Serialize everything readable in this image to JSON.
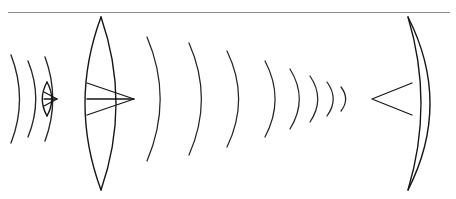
{
  "figure": {
    "kind": "line-drawing",
    "width": 456,
    "height": 199,
    "background_color": "#ffffff",
    "ink_color": "#1a1a1a",
    "rule_color": "#8e8e8e",
    "labels": [],
    "annotations": []
  },
  "top_rule": {
    "name": "horizontal-top-rule",
    "x1": 8,
    "y1": 12.5,
    "x2": 450,
    "y2": 12.5,
    "color": "#8e8e8e",
    "width": 1.1
  },
  "optical_axis": {
    "y": 99,
    "x_start": 18,
    "x_end": 440
  },
  "source_wavefronts": {
    "name": "diverging-source-wavefronts",
    "description": "Three short arcs diverging rightward from a point source at far left",
    "count": 3,
    "center_y": 99,
    "arcs": [
      {
        "x_vertex": 22,
        "radius": 46,
        "half_height": 44,
        "bulge": 11
      },
      {
        "x_vertex": 38,
        "radius": 40,
        "half_height": 38,
        "bulge": 10
      },
      {
        "x_vertex": 55,
        "radius": 44,
        "half_height": 42,
        "bulge": 10
      }
    ]
  },
  "small_lens": {
    "name": "small-biconvex-lens",
    "center_x": 47,
    "center_y": 99,
    "half_height": 17,
    "bulge": 4.5,
    "cone": {
      "apex_x": 57,
      "base_x": 44,
      "half_height": 7
    }
  },
  "main_lens": {
    "name": "large-biconvex-lens",
    "center_x": 101,
    "top_y": 17,
    "bottom_y": 190,
    "left_bulge": 16,
    "right_bulge": 15,
    "cone": {
      "base_x": 87,
      "apex_x": 134,
      "half_height": 16
    }
  },
  "converging_wavefronts": {
    "name": "converging-wavefronts",
    "description": "Series of arcs that shrink as they converge toward a focus on the right",
    "count": 8,
    "center_y": 99,
    "arcs": [
      {
        "x_vertex": 164,
        "half_height": 62,
        "bulge": 17
      },
      {
        "x_vertex": 205,
        "half_height": 56,
        "bulge": 16
      },
      {
        "x_vertex": 242,
        "half_height": 48,
        "bulge": 15
      },
      {
        "x_vertex": 278,
        "half_height": 38,
        "bulge": 13
      },
      {
        "x_vertex": 302,
        "half_height": 30,
        "bulge": 12
      },
      {
        "x_vertex": 320,
        "half_height": 23,
        "bulge": 10
      },
      {
        "x_vertex": 335,
        "half_height": 17,
        "bulge": 8
      },
      {
        "x_vertex": 347,
        "half_height": 12,
        "bulge": 6
      }
    ]
  },
  "right_mirror": {
    "name": "concave-meniscus-element",
    "front_x": 408,
    "top_y": 17,
    "bottom_y": 190,
    "outer_bulge": 22,
    "inner_bulge": 13,
    "cone": {
      "apex_x": 372,
      "base_x": 412,
      "half_height": 16
    }
  }
}
